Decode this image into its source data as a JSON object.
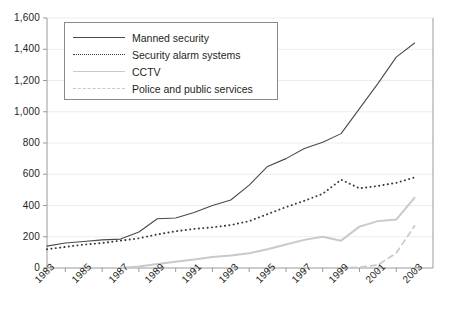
{
  "chart_data": {
    "type": "line",
    "title": "",
    "subtitle": "",
    "xlabel": "",
    "ylabel": "",
    "xlim": [
      1983,
      2004
    ],
    "ylim": [
      0,
      1600
    ],
    "grid": true,
    "legend_position": "top-left",
    "x": [
      1983,
      1984,
      1985,
      1986,
      1987,
      1988,
      1989,
      1990,
      1991,
      1992,
      1993,
      1994,
      1995,
      1996,
      1997,
      1998,
      1999,
      2000,
      2001,
      2002,
      2003
    ],
    "xtick_labels": [
      "1983",
      "1985",
      "1987",
      "1989",
      "1991",
      "1993",
      "1995",
      "1997",
      "1999",
      "2001",
      "2003"
    ],
    "ytick_labels": [
      "0",
      "200",
      "400",
      "600",
      "800",
      "1,000",
      "1,200",
      "1,400",
      "1,600"
    ],
    "ytick_values": [
      0,
      200,
      400,
      600,
      800,
      1000,
      1200,
      1400,
      1600
    ],
    "series": [
      {
        "name": "Manned security",
        "style": "solid",
        "color": "#4a4a4a",
        "values": [
          140,
          160,
          170,
          180,
          185,
          230,
          315,
          320,
          355,
          400,
          435,
          530,
          650,
          700,
          765,
          805,
          860,
          1020,
          1180,
          1350,
          1440
        ]
      },
      {
        "name": "Security alarm systems",
        "style": "dotted",
        "color": "#3a3a3a",
        "values": [
          120,
          135,
          150,
          160,
          175,
          190,
          215,
          235,
          250,
          260,
          275,
          300,
          345,
          390,
          430,
          475,
          565,
          510,
          525,
          545,
          580
        ]
      },
      {
        "name": "CCTV",
        "style": "solid",
        "color": "#c9c9c9",
        "values": [
          0,
          0,
          0,
          0,
          0,
          10,
          25,
          40,
          55,
          70,
          80,
          95,
          120,
          150,
          180,
          200,
          175,
          265,
          300,
          310,
          450
        ]
      },
      {
        "name": "Police and public services",
        "style": "dashed",
        "color": "#c9c9c9",
        "values": [
          0,
          0,
          0,
          0,
          0,
          0,
          0,
          0,
          0,
          0,
          0,
          0,
          0,
          0,
          0,
          0,
          0,
          5,
          20,
          95,
          270
        ]
      }
    ]
  },
  "legend": {
    "items": [
      {
        "label": "Manned security",
        "swatch": "line-solid-dark-icon"
      },
      {
        "label": "Security alarm systems",
        "swatch": "line-dotted-dark-icon"
      },
      {
        "label": "CCTV",
        "swatch": "line-solid-light-icon"
      },
      {
        "label": "Police and public services",
        "swatch": "line-dashed-light-icon"
      }
    ]
  },
  "colors": {
    "manned_security": "#4a4a4a",
    "security_alarm_systems": "#3a3a3a",
    "cctv": "#c9c9c9",
    "police_public_services": "#c9c9c9",
    "axis": "#9a9a9a",
    "grid": "#ededed",
    "text": "#231f20",
    "background": "#ffffff"
  }
}
